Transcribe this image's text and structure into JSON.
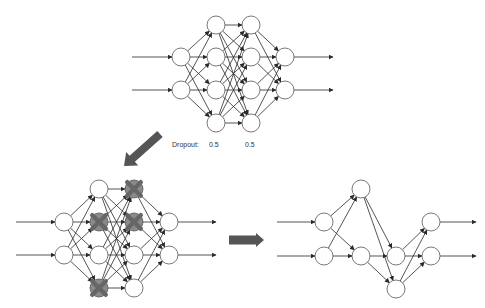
{
  "colors": {
    "line": "#2a2a2a",
    "node_stroke": "#555555",
    "node_fill": "#ffffff",
    "dropped": "#666666",
    "big_arrow": "#555555"
  },
  "dropout": {
    "label": "Dropout:",
    "rates": [
      "0.5",
      "0.5"
    ]
  },
  "networks": {
    "full": {
      "radius": 9,
      "input_arrow_x": 132,
      "output_arrow_x": 333,
      "layers": [
        {
          "x": 181,
          "ys": [
            57,
            90
          ]
        },
        {
          "x": 216,
          "ys": [
            25,
            57,
            90,
            123
          ]
        },
        {
          "x": 251,
          "ys": [
            25,
            57,
            90,
            123
          ]
        },
        {
          "x": 285,
          "ys": [
            57,
            90
          ]
        }
      ]
    },
    "dropped": {
      "radius": 9,
      "input_arrow_x": 16,
      "output_arrow_x": 216,
      "layers": [
        {
          "x": 64,
          "ys": [
            222,
            255
          ]
        },
        {
          "x": 99,
          "ys": [
            189,
            222,
            255,
            288
          ],
          "dropped": [
            false,
            true,
            false,
            true
          ]
        },
        {
          "x": 134,
          "ys": [
            189,
            222,
            255,
            288
          ],
          "dropped": [
            true,
            true,
            false,
            false
          ]
        },
        {
          "x": 169,
          "ys": [
            222,
            255
          ]
        }
      ]
    },
    "thinned": {
      "radius": 9,
      "input_arrow_x": 277,
      "output_arrow_x": 476,
      "layers": [
        {
          "x": 324,
          "ys": [
            222,
            256
          ]
        },
        {
          "x": 361,
          "ys": [
            189,
            256
          ]
        },
        {
          "x": 396,
          "ys": [
            256,
            289
          ]
        },
        {
          "x": 431,
          "ys": [
            222,
            256
          ]
        }
      ]
    }
  },
  "arrows": {
    "diagonal": {
      "from": [
        160,
        134
      ],
      "to": [
        124,
        166
      ]
    },
    "right": {
      "from": [
        229,
        240
      ],
      "to": [
        264,
        240
      ]
    }
  }
}
